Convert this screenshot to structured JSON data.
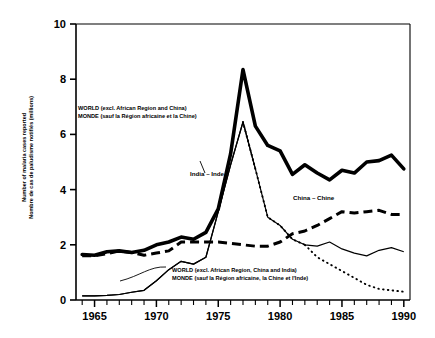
{
  "chart_data": {
    "type": "line",
    "title": "",
    "xlabel": "",
    "ylabel_en": "Number of malaria cases reported",
    "ylabel_fr": "Nombre de cas de paludisme notifiés (millions)",
    "xlim": [
      1963.5,
      1990.5
    ],
    "ylim": [
      0,
      10
    ],
    "x_ticks": [
      1965,
      1970,
      1975,
      1980,
      1985,
      1990
    ],
    "x_tick_labels": [
      "1965",
      "1970",
      "1975",
      "1980",
      "1985",
      "1990"
    ],
    "x_minor_tick_step": 1,
    "y_ticks": [
      0,
      2,
      4,
      6,
      8,
      10
    ],
    "y_tick_labels": [
      "0",
      "2",
      "4",
      "6",
      "8",
      "10"
    ],
    "grid": false,
    "legend_position": "inline-annotations",
    "units": "millions",
    "x": [
      1964,
      1965,
      1966,
      1967,
      1968,
      1969,
      1970,
      1971,
      1972,
      1973,
      1974,
      1975,
      1976,
      1977,
      1978,
      1979,
      1980,
      1981,
      1982,
      1983,
      1984,
      1985,
      1986,
      1987,
      1988,
      1989,
      1990
    ],
    "series": [
      {
        "name": "WORLD (excl. African Region and China)",
        "name_fr": "MONDE (sauf la Région africaine et la Chine)",
        "style": "thick-solid",
        "color": "#000000",
        "values": [
          1.65,
          1.62,
          1.75,
          1.78,
          1.72,
          1.8,
          2.0,
          2.1,
          2.28,
          2.2,
          2.45,
          3.3,
          5.3,
          8.35,
          6.3,
          5.6,
          5.4,
          4.55,
          4.9,
          4.6,
          4.35,
          4.7,
          4.6,
          5.0,
          5.05,
          5.25,
          4.75
        ]
      },
      {
        "name": "India – Inde",
        "style": "thin-solid-then-dotted",
        "color": "#000000",
        "values": [
          0.15,
          0.15,
          0.17,
          0.2,
          0.28,
          0.35,
          0.7,
          1.1,
          1.4,
          1.3,
          1.55,
          3.2,
          4.9,
          6.45,
          4.75,
          3.0,
          2.7,
          2.2,
          2.0,
          1.55,
          1.3,
          1.05,
          0.8,
          0.55,
          0.4,
          0.35,
          0.3
        ]
      },
      {
        "name": "China – Chine",
        "style": "dashed",
        "color": "#000000",
        "values": [
          1.6,
          1.6,
          1.68,
          1.78,
          1.72,
          1.62,
          1.7,
          1.78,
          2.1,
          2.1,
          2.1,
          2.1,
          2.05,
          2.0,
          1.95,
          1.95,
          2.1,
          2.4,
          2.5,
          2.7,
          2.95,
          3.2,
          3.15,
          3.2,
          3.25,
          3.1,
          3.1
        ]
      },
      {
        "name": "WORLD (excl. African Region, China and India)",
        "name_fr": "MONDE (sauf la Région africaine, la Chine et l'Inde)",
        "style": "thin-solid",
        "color": "#000000",
        "values": [
          0.15,
          0.15,
          0.17,
          0.2,
          0.28,
          0.35,
          0.7,
          1.1,
          1.4,
          1.3,
          1.55,
          3.2,
          4.9,
          6.45,
          4.75,
          3.0,
          2.7,
          2.2,
          2.0,
          1.95,
          2.1,
          1.85,
          1.7,
          1.6,
          1.8,
          1.9,
          1.75
        ]
      }
    ],
    "annotations": [
      {
        "id": "annot-world-excl-africa-china",
        "line1": "WORLD (excl. African Region and China)",
        "line2": "MONDE (sauf la Région africaine et la Chine)",
        "x_px": 78,
        "y_px": 110
      },
      {
        "id": "annot-world-excl-africa-china-india",
        "line1": "WORLD (excl. African Region, China and India)",
        "line2": "MONDE (sauf la Région africaine, la Chine et l'Inde)",
        "x_px": 172,
        "y_px": 272
      }
    ],
    "inline_labels": [
      {
        "id": "label-india",
        "text": "India – Inde",
        "x_px": 190,
        "y_px": 176
      },
      {
        "id": "label-china",
        "text": "China – Chine",
        "x_px": 293,
        "y_px": 200
      }
    ]
  }
}
